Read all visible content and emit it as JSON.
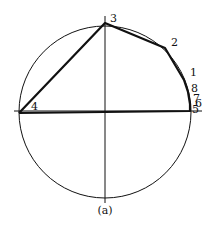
{
  "diagram": {
    "caption": "(a)",
    "circle": {
      "cx": 105,
      "cy": 112,
      "r": 86
    },
    "axes": {
      "vertical": {
        "x": 105,
        "y1": 16,
        "y2": 203
      },
      "horizontal": {
        "y": 111,
        "x1": 14,
        "x2": 202
      }
    },
    "points": [
      {
        "label": "1",
        "x": 184,
        "y": 80,
        "lx": 190,
        "ly": 76
      },
      {
        "label": "2",
        "x": 165,
        "y": 48,
        "lx": 171,
        "ly": 46
      },
      {
        "label": "3",
        "x": 105,
        "y": 23,
        "lx": 110,
        "ly": 22
      },
      {
        "label": "4",
        "x": 19,
        "y": 113,
        "lx": 31,
        "ly": 110
      },
      {
        "label": "5",
        "x": 190,
        "y": 111,
        "lx": 192,
        "ly": 113
      },
      {
        "label": "6",
        "x": 190,
        "y": 104,
        "lx": 195,
        "ly": 107
      },
      {
        "label": "7",
        "x": 189,
        "y": 98,
        "lx": 193,
        "ly": 102
      },
      {
        "label": "8",
        "x": 188,
        "y": 92,
        "lx": 191,
        "ly": 92
      }
    ],
    "polygon_order": [
      "4",
      "3",
      "2",
      "1",
      "8",
      "7",
      "6",
      "5",
      "4"
    ],
    "stroke_color": "#111111",
    "background": "#ffffff"
  }
}
